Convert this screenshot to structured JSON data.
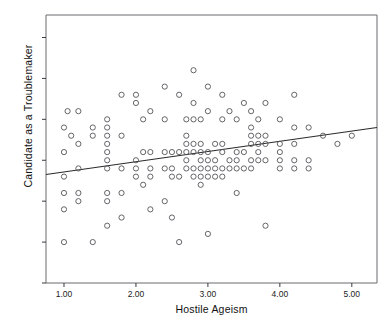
{
  "chart_data": {
    "type": "scatter",
    "title": "",
    "xlabel": "Hostile Ageism",
    "ylabel": "Candidate as a Troublemaker",
    "xlim": [
      0.75,
      5.35
    ],
    "ylim": [
      0.0,
      6.55
    ],
    "xticks": [
      1.0,
      2.0,
      3.0,
      4.0,
      5.0
    ],
    "xtick_labels": [
      "1.00",
      "2.00",
      "3.00",
      "4.00",
      "5.00"
    ],
    "yticks": [
      0.0,
      1.0,
      2.0,
      3.0,
      4.0,
      5.0,
      6.0
    ],
    "ytick_labels": [
      ".00",
      "1.00",
      "2.00",
      "3.00",
      "4.00",
      "5.00",
      "6.00"
    ],
    "grid": false,
    "legend": false,
    "marker": "open-circle",
    "marker_color": "#55555a",
    "point_size": 5,
    "fit_line": {
      "type": "linear",
      "color": "#2b2b2b",
      "x_start": 0.75,
      "y_start": 2.65,
      "x_end": 5.35,
      "y_end": 3.8,
      "slope": 0.25,
      "intercept": 2.46
    },
    "points": [
      [
        1.0,
        3.8
      ],
      [
        1.0,
        3.2
      ],
      [
        1.0,
        2.6
      ],
      [
        1.0,
        2.2
      ],
      [
        1.0,
        1.8
      ],
      [
        1.0,
        1.0
      ],
      [
        1.05,
        4.2
      ],
      [
        1.1,
        3.6
      ],
      [
        1.2,
        4.2
      ],
      [
        1.2,
        3.4
      ],
      [
        1.2,
        2.8
      ],
      [
        1.2,
        2.2
      ],
      [
        1.2,
        2.0
      ],
      [
        1.4,
        3.8
      ],
      [
        1.4,
        3.6
      ],
      [
        1.4,
        1.0
      ],
      [
        1.6,
        4.0
      ],
      [
        1.6,
        3.8
      ],
      [
        1.6,
        3.6
      ],
      [
        1.6,
        3.4
      ],
      [
        1.6,
        3.2
      ],
      [
        1.6,
        3.0
      ],
      [
        1.6,
        2.8
      ],
      [
        1.6,
        2.2
      ],
      [
        1.6,
        2.0
      ],
      [
        1.6,
        1.4
      ],
      [
        1.8,
        4.6
      ],
      [
        1.8,
        3.6
      ],
      [
        1.8,
        2.8
      ],
      [
        1.8,
        2.2
      ],
      [
        1.8,
        1.6
      ],
      [
        2.0,
        4.6
      ],
      [
        2.0,
        4.4
      ],
      [
        2.0,
        3.0
      ],
      [
        2.0,
        2.8
      ],
      [
        2.0,
        2.6
      ],
      [
        2.1,
        4.0
      ],
      [
        2.1,
        3.2
      ],
      [
        2.1,
        2.4
      ],
      [
        2.2,
        4.2
      ],
      [
        2.2,
        3.2
      ],
      [
        2.2,
        2.8
      ],
      [
        2.2,
        2.6
      ],
      [
        2.2,
        1.8
      ],
      [
        2.4,
        4.8
      ],
      [
        2.4,
        4.0
      ],
      [
        2.4,
        3.2
      ],
      [
        2.4,
        2.8
      ],
      [
        2.4,
        2.0
      ],
      [
        2.5,
        3.2
      ],
      [
        2.5,
        2.8
      ],
      [
        2.5,
        2.6
      ],
      [
        2.5,
        1.6
      ],
      [
        2.6,
        4.6
      ],
      [
        2.6,
        3.2
      ],
      [
        2.6,
        2.6
      ],
      [
        2.6,
        1.0
      ],
      [
        2.7,
        4.0
      ],
      [
        2.7,
        3.6
      ],
      [
        2.7,
        3.4
      ],
      [
        2.7,
        3.2
      ],
      [
        2.7,
        3.0
      ],
      [
        2.7,
        2.8
      ],
      [
        2.8,
        5.2
      ],
      [
        2.8,
        4.4
      ],
      [
        2.8,
        4.0
      ],
      [
        2.8,
        3.4
      ],
      [
        2.8,
        3.2
      ],
      [
        2.8,
        2.8
      ],
      [
        2.8,
        2.6
      ],
      [
        2.9,
        4.0
      ],
      [
        2.9,
        3.4
      ],
      [
        2.9,
        3.2
      ],
      [
        2.9,
        3.0
      ],
      [
        2.9,
        2.8
      ],
      [
        2.9,
        2.6
      ],
      [
        2.9,
        2.4
      ],
      [
        3.0,
        4.8
      ],
      [
        3.0,
        4.2
      ],
      [
        3.0,
        3.2
      ],
      [
        3.0,
        3.0
      ],
      [
        3.0,
        2.8
      ],
      [
        3.0,
        2.6
      ],
      [
        3.0,
        1.2
      ],
      [
        3.1,
        3.4
      ],
      [
        3.1,
        3.0
      ],
      [
        3.1,
        2.8
      ],
      [
        3.1,
        2.6
      ],
      [
        3.2,
        4.6
      ],
      [
        3.2,
        4.0
      ],
      [
        3.2,
        3.4
      ],
      [
        3.2,
        3.2
      ],
      [
        3.2,
        2.8
      ],
      [
        3.2,
        2.6
      ],
      [
        3.3,
        4.2
      ],
      [
        3.3,
        3.0
      ],
      [
        3.3,
        2.8
      ],
      [
        3.4,
        4.0
      ],
      [
        3.4,
        3.2
      ],
      [
        3.4,
        3.0
      ],
      [
        3.4,
        2.8
      ],
      [
        3.4,
        2.2
      ],
      [
        3.5,
        4.4
      ],
      [
        3.5,
        3.2
      ],
      [
        3.5,
        2.8
      ],
      [
        3.6,
        4.2
      ],
      [
        3.6,
        3.8
      ],
      [
        3.6,
        3.6
      ],
      [
        3.6,
        3.4
      ],
      [
        3.6,
        3.0
      ],
      [
        3.6,
        2.8
      ],
      [
        3.7,
        4.0
      ],
      [
        3.7,
        3.6
      ],
      [
        3.7,
        3.4
      ],
      [
        3.7,
        3.2
      ],
      [
        3.7,
        3.0
      ],
      [
        3.8,
        4.4
      ],
      [
        3.8,
        3.6
      ],
      [
        3.8,
        3.4
      ],
      [
        3.8,
        3.0
      ],
      [
        3.8,
        1.4
      ],
      [
        4.0,
        4.0
      ],
      [
        4.0,
        3.4
      ],
      [
        4.0,
        3.2
      ],
      [
        4.0,
        3.0
      ],
      [
        4.0,
        2.8
      ],
      [
        4.2,
        4.6
      ],
      [
        4.2,
        3.8
      ],
      [
        4.2,
        3.4
      ],
      [
        4.2,
        3.0
      ],
      [
        4.2,
        2.8
      ],
      [
        4.4,
        3.8
      ],
      [
        4.4,
        3.0
      ],
      [
        4.4,
        2.8
      ],
      [
        4.6,
        3.6
      ],
      [
        4.8,
        3.4
      ],
      [
        5.0,
        3.6
      ]
    ]
  },
  "axis": {
    "xlabel": "Hostile Ageism",
    "ylabel": "Candidate as a Troublemaker"
  }
}
